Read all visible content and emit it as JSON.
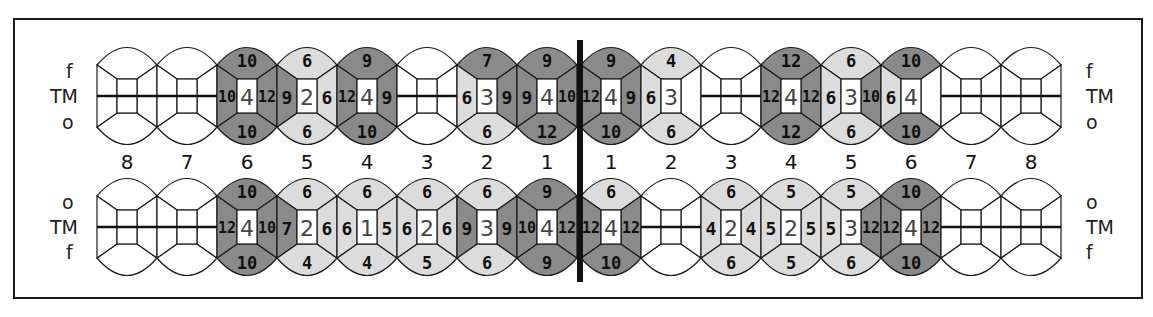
{
  "legend": {
    "upper": {
      "top": "f",
      "mid": "TM",
      "bottom": "o"
    },
    "lower": {
      "top": "o",
      "mid": "TM",
      "bottom": "f"
    }
  },
  "tooth_numbers": {
    "left": [
      "8",
      "7",
      "6",
      "5",
      "4",
      "3",
      "2",
      "1"
    ],
    "right": [
      "1",
      "2",
      "3",
      "4",
      "5",
      "6",
      "7",
      "8"
    ]
  },
  "colors": {
    "dark": "#8a8a8a",
    "light": "#dcdcdc",
    "empty": "#ffffff",
    "line": "#1a1a1a"
  },
  "upper_row": [
    {
      "tooth": "8",
      "side": "left",
      "missing": true
    },
    {
      "tooth": "7",
      "side": "left",
      "missing": true
    },
    {
      "tooth": "6",
      "side": "left",
      "top": "10",
      "left": "10",
      "center": "4",
      "right": "12",
      "bottom": "10"
    },
    {
      "tooth": "5",
      "side": "left",
      "top": "6",
      "left": "9",
      "center": "2",
      "right": "6",
      "bottom": "6"
    },
    {
      "tooth": "4",
      "side": "left",
      "top": "9",
      "left": "12",
      "center": "4",
      "right": "9",
      "bottom": "10"
    },
    {
      "tooth": "3",
      "side": "left",
      "missing": true
    },
    {
      "tooth": "2",
      "side": "left",
      "top": "7",
      "left": "6",
      "center": "3",
      "right": "9",
      "bottom": "6"
    },
    {
      "tooth": "1",
      "side": "left",
      "top": "9",
      "left": "9",
      "center": "4",
      "right": "10",
      "bottom": "12"
    },
    {
      "tooth": "1",
      "side": "right",
      "top": "9",
      "left": "12",
      "center": "4",
      "right": "9",
      "bottom": "10"
    },
    {
      "tooth": "2",
      "side": "right",
      "top": "4",
      "left": "6",
      "center": "3",
      "right": "",
      "bottom": "6"
    },
    {
      "tooth": "3",
      "side": "right",
      "missing": true
    },
    {
      "tooth": "4",
      "side": "right",
      "top": "12",
      "left": "12",
      "center": "4",
      "right": "12",
      "bottom": "12"
    },
    {
      "tooth": "5",
      "side": "right",
      "top": "6",
      "left": "6",
      "center": "3",
      "right": "10",
      "bottom": "6"
    },
    {
      "tooth": "6",
      "side": "right",
      "top": "10",
      "left": "6",
      "center": "4",
      "right": "",
      "bottom": "10"
    },
    {
      "tooth": "7",
      "side": "right",
      "missing": true
    },
    {
      "tooth": "8",
      "side": "right",
      "missing": true
    }
  ],
  "lower_row": [
    {
      "tooth": "8",
      "side": "left",
      "missing": true
    },
    {
      "tooth": "7",
      "side": "left",
      "missing": true
    },
    {
      "tooth": "6",
      "side": "left",
      "top": "10",
      "left": "12",
      "center": "4",
      "right": "10",
      "bottom": "10"
    },
    {
      "tooth": "5",
      "side": "left",
      "top": "6",
      "left": "7",
      "center": "2",
      "right": "6",
      "bottom": "4"
    },
    {
      "tooth": "4",
      "side": "left",
      "top": "6",
      "left": "6",
      "center": "1",
      "right": "5",
      "bottom": "4"
    },
    {
      "tooth": "3",
      "side": "left",
      "top": "6",
      "left": "6",
      "center": "2",
      "right": "6",
      "bottom": "5"
    },
    {
      "tooth": "2",
      "side": "left",
      "top": "6",
      "left": "9",
      "center": "3",
      "right": "9",
      "bottom": "6"
    },
    {
      "tooth": "1",
      "side": "left",
      "top": "9",
      "left": "10",
      "center": "4",
      "right": "12",
      "bottom": "9"
    },
    {
      "tooth": "1",
      "side": "right",
      "top": "6",
      "left": "12",
      "center": "4",
      "right": "12",
      "bottom": "10"
    },
    {
      "tooth": "2",
      "side": "right",
      "missing": true
    },
    {
      "tooth": "3",
      "side": "right",
      "top": "6",
      "left": "4",
      "center": "2",
      "right": "4",
      "bottom": "6"
    },
    {
      "tooth": "4",
      "side": "right",
      "top": "5",
      "left": "5",
      "center": "2",
      "right": "5",
      "bottom": "5"
    },
    {
      "tooth": "5",
      "side": "right",
      "top": "5",
      "left": "5",
      "center": "3",
      "right": "12",
      "bottom": "6"
    },
    {
      "tooth": "6",
      "side": "right",
      "top": "10",
      "left": "12",
      "center": "4",
      "right": "12",
      "bottom": "10"
    },
    {
      "tooth": "7",
      "side": "right",
      "missing": true
    },
    {
      "tooth": "8",
      "side": "right",
      "missing": true
    }
  ]
}
